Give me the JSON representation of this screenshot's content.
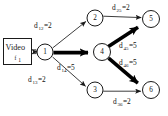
{
  "figure": {
    "type": "directed-graph",
    "source_box": {
      "label": "Video",
      "subscript": "f",
      "sub_index": "1"
    },
    "nodes": [
      {
        "id": "1",
        "label": "1",
        "cx": 45,
        "cy": 52,
        "r": 8.0
      },
      {
        "id": "2",
        "label": "2",
        "cx": 95,
        "cy": 18,
        "r": 8.0
      },
      {
        "id": "3",
        "label": "3",
        "cx": 95,
        "cy": 90,
        "r": 8.0
      },
      {
        "id": "4",
        "label": "4",
        "cx": 102,
        "cy": 52,
        "r": 8.5
      },
      {
        "id": "5",
        "label": "5",
        "cx": 151,
        "cy": 19,
        "r": 8.5
      },
      {
        "id": "6",
        "label": "6",
        "cx": 151,
        "cy": 90,
        "r": 8.5
      }
    ],
    "edges": [
      {
        "from": "1",
        "to": "2",
        "weight": "2",
        "sym": "d",
        "sub": "12",
        "bold": false
      },
      {
        "from": "1",
        "to": "4",
        "weight": "5",
        "sym": "d",
        "sub": "14",
        "bold": true
      },
      {
        "from": "1",
        "to": "3",
        "weight": "2",
        "sym": "d",
        "sub": "13",
        "bold": false
      },
      {
        "from": "2",
        "to": "5",
        "weight": "2",
        "sym": "d",
        "sub": "25",
        "bold": false
      },
      {
        "from": "4",
        "to": "5",
        "weight": "5",
        "sym": "d",
        "sub": "45",
        "bold": true
      },
      {
        "from": "4",
        "to": "6",
        "weight": "5",
        "sym": "d",
        "sub": "46",
        "bold": true
      },
      {
        "from": "3",
        "to": "6",
        "weight": "2",
        "sym": "d",
        "sub": "36",
        "bold": false
      }
    ],
    "edge_labels": [
      {
        "name": "edge-label-d12",
        "main_pre": "d",
        "sub": "12",
        "main_post": "=2",
        "x": 34,
        "y": 28
      },
      {
        "main_pre": "d",
        "sub": "14",
        "main_post": "=5",
        "x": 57,
        "y": 70,
        "name": "edge-label-d14"
      },
      {
        "main_pre": "d",
        "sub": "13",
        "main_post": "=2",
        "x": 28,
        "y": 82,
        "name": "edge-label-d13"
      },
      {
        "main_pre": "d",
        "sub": "25",
        "main_post": "=2",
        "x": 112,
        "y": 10,
        "name": "edge-label-d25"
      },
      {
        "main_pre": "d",
        "sub": "45",
        "main_post": "=5",
        "x": 119,
        "y": 48,
        "name": "edge-label-d45"
      },
      {
        "main_pre": "d",
        "sub": "46",
        "main_post": "=5",
        "x": 119,
        "y": 65,
        "name": "edge-label-d46"
      },
      {
        "main_pre": "d",
        "sub": "36",
        "main_post": "=2",
        "x": 113,
        "y": 104,
        "name": "edge-label-d36"
      }
    ],
    "colors": {
      "stroke": "#1a1a1a",
      "bold_stroke": "#000000",
      "node_fill": "#ffffff",
      "background": "#ffffff",
      "text": "#111111"
    }
  }
}
